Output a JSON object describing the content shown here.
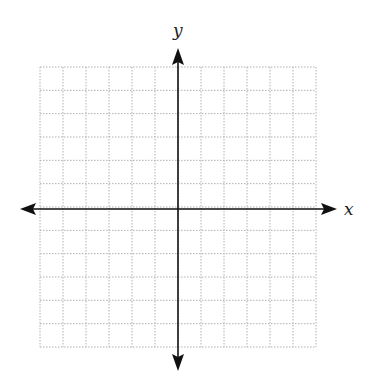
{
  "diagram": {
    "type": "coordinate-plane",
    "x_axis_label": "x",
    "y_axis_label": "y",
    "grid": {
      "columns": 12,
      "rows": 12,
      "line_style": "dotted",
      "line_color": "#b0b0b0"
    },
    "axis_color": "#111111"
  }
}
